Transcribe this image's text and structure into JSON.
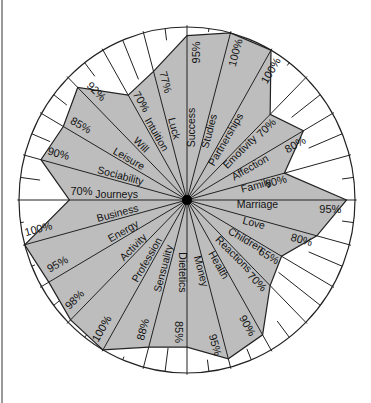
{
  "chart_data": {
    "type": "radar",
    "title": "",
    "center": [
      187,
      200
    ],
    "radius": [
      168,
      173
    ],
    "start_angle_deg": 0,
    "angle_step_deg": 15,
    "direction": "counterclockwise",
    "fill_color": "#bdbdbd",
    "line_color": "#222222",
    "value_range": [
      0,
      100
    ],
    "categories": [
      "Marriage",
      "Family",
      "Affection",
      "Emotivity",
      "Partnerships",
      "Studies",
      "Success",
      "Luck",
      "Intuition",
      "Will",
      "Leisure",
      "Sociability",
      "Journeys",
      "Business",
      "Energy",
      "Activity",
      "Profession",
      "Sensuality",
      "Dietetics",
      "Money",
      "Health",
      "Reactions",
      "Children",
      "Love"
    ],
    "values": [
      95,
      60,
      80,
      70,
      100,
      100,
      95,
      77,
      70,
      92,
      85,
      90,
      70,
      100,
      95,
      98,
      100,
      88,
      85,
      95,
      90,
      70,
      65,
      80
    ],
    "value_labels": [
      "95%",
      "60%",
      "80%",
      "70%",
      "100%",
      "100%",
      "95%",
      "77%",
      "70%",
      "92%",
      "85%",
      "90%",
      "70%",
      "100%",
      "95%",
      "98%",
      "100%",
      "88%",
      "85%",
      "95%",
      "90%",
      "70%",
      "65%",
      "80%"
    ],
    "grid": false,
    "legend": null
  }
}
